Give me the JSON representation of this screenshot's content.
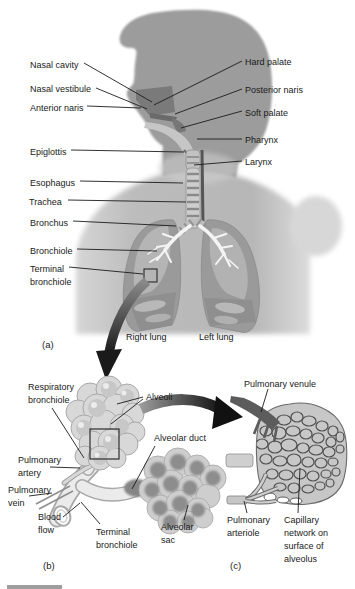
{
  "figure": {
    "background": "#ffffff",
    "panel_a": {
      "tag": "(a)",
      "labels": {
        "nasal_cavity": "Nasal cavity",
        "nasal_vestibule": "Nasal vestibule",
        "anterior_naris": "Anterior naris",
        "epiglottis": "Epiglottis",
        "esophagus": "Esophagus",
        "trachea": "Trachea",
        "bronchus": "Bronchus",
        "bronchiole": "Bronchiole",
        "terminal_bronchiole": "Terminal bronchiole",
        "hard_palate": "Hard palate",
        "posterior_naris": "Posterior naris",
        "soft_palate": "Soft palate",
        "pharynx": "Pharynx",
        "larynx": "Larynx",
        "right_lung": "Right lung",
        "left_lung": "Left lung"
      }
    },
    "panel_b": {
      "tag": "(b)",
      "labels": {
        "respiratory_bronchiole": "Respiratory bronchiole",
        "alveoli": "Alveoli",
        "alveolar_duct": "Alveolar duct",
        "pulmonary_artery": "Pulmonary artery",
        "pulmonary_vein": "Pulmonary vein",
        "blood_flow": "Blood flow",
        "terminal_bronchiole": "Terminal bronchiole",
        "alveolar_sac": "Alveolar sac"
      }
    },
    "panel_c": {
      "tag": "(c)",
      "labels": {
        "pulmonary_venule": "Pulmonary venule",
        "pulmonary_arteriole": "Pulmonary arteriole",
        "capillary_network": "Capillary network on surface of alveolus"
      }
    },
    "colors": {
      "background": "#ffffff",
      "silhouette": "#9c9c9c",
      "torso": "#bdbdbd",
      "lung": "#9a9a9a",
      "lung_inner": "#b5b5b5",
      "airway": "#f4f4f4",
      "alveoli": "#d8d8d8",
      "alveolar_sac_inner": "#8d8d8d",
      "capillary_mesh": "#4f4f4f",
      "venule": "#5c5c5c",
      "vessel_light": "#d6d6d6",
      "arrow": "#1a1a1a",
      "leader_line": "#1c1c1c",
      "text": "#1a1a1a"
    }
  }
}
